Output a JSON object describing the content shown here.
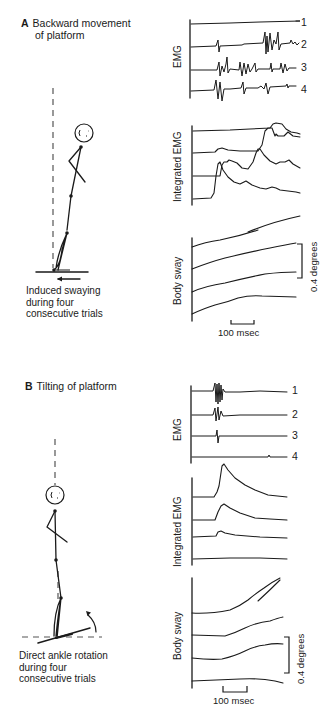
{
  "panel_a": {
    "letter": "A",
    "title_line1": "Backward movement",
    "title_line2": "of platform",
    "caption_line1": "Induced swaying",
    "caption_line2": "during four",
    "caption_line3": "consecutive trials",
    "emg_label": "EMG",
    "iemg_label": "Integrated EMG",
    "sway_label": "Body sway",
    "trace_numbers": [
      "1",
      "2",
      "3",
      "4"
    ],
    "time_scale": "100 msec",
    "angle_scale": "0.4 degrees"
  },
  "panel_b": {
    "letter": "B",
    "title_line1": "Tilting of platform",
    "caption_line1": "Direct ankle rotation",
    "caption_line2": "during four",
    "caption_line3": "consecutive trials",
    "emg_label": "EMG",
    "iemg_label": "Integrated EMG",
    "sway_label": "Body sway",
    "trace_numbers": [
      "1",
      "2",
      "3",
      "4"
    ],
    "time_scale": "100 msec",
    "angle_scale": "0.4 degrees"
  },
  "colors": {
    "ink": "#1a1a1a",
    "background": "#ffffff",
    "dashed": "#555555"
  }
}
